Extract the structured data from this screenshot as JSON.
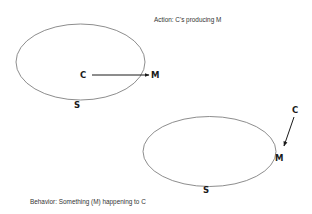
{
  "action_diagram": {
    "caption": "Action: C's producing M",
    "system_label": "S",
    "cause_label": "C",
    "effect_label": "M"
  },
  "behavior_diagram": {
    "caption": "Behavior: Something (M) happening to C",
    "system_label": "S",
    "cause_label": "C",
    "effect_label": "M"
  }
}
